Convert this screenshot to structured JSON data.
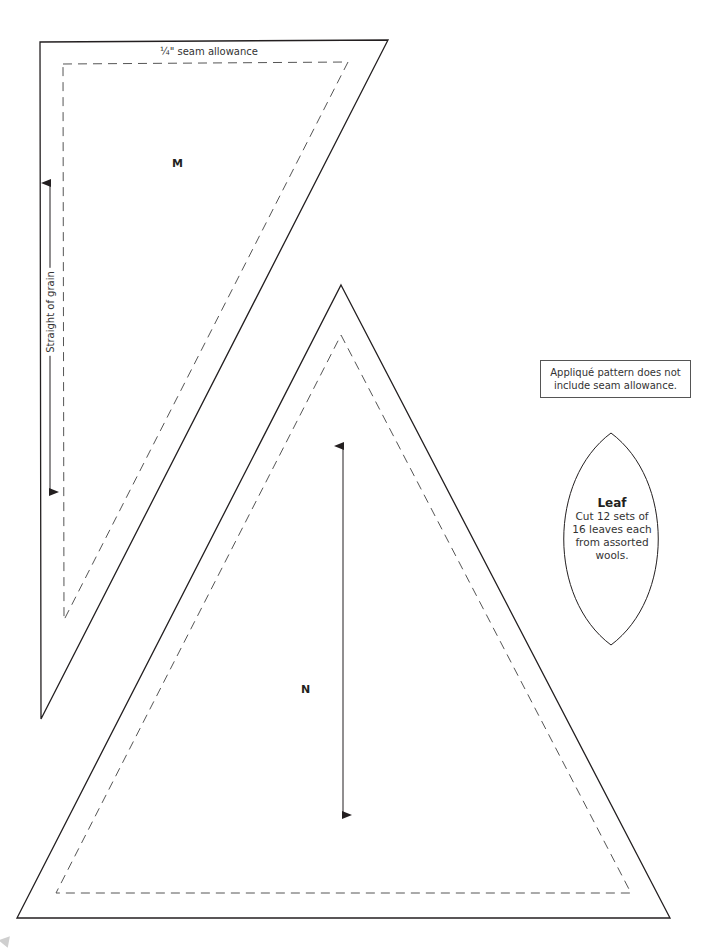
{
  "pieces": {
    "m": {
      "letter": "M",
      "seam_label": "¼\" seam allowance",
      "grain_label": "Straight of grain",
      "outer_points": "40,42 388,40 41,719",
      "inner_points": "63,64 348,62 64,620"
    },
    "n": {
      "letter": "N",
      "outer_points": "341,285 670,918 17,918",
      "inner_points": "341,335 631,893 56,893"
    },
    "leaf": {
      "title": "Leaf",
      "lines": [
        "Cut 12 sets of",
        "16 leaves each",
        "from assorted",
        "wools."
      ]
    }
  },
  "callout": {
    "lines": [
      "Appliqué pattern does not",
      "include seam allowance."
    ]
  },
  "colors": {
    "line": "#231f20",
    "dashed": "#555555",
    "background": "#ffffff"
  }
}
